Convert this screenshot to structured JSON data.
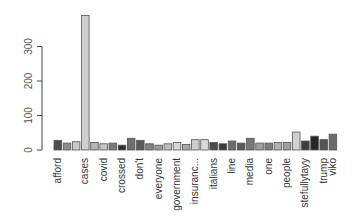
{
  "chart_data": {
    "type": "bar",
    "title": "",
    "xlabel": "",
    "ylabel": "",
    "ylim": [
      0,
      400
    ],
    "yticks": [
      0,
      100,
      200,
      300
    ],
    "grid": false,
    "legend": null,
    "x_label_rotation": -90,
    "categories": [
      "afford",
      "",
      "",
      "cases",
      "",
      "covid",
      "",
      "crossed",
      "",
      "don't",
      "",
      "everyone",
      "",
      "government",
      "",
      "insuranc...",
      "",
      "italians",
      "",
      "line",
      "",
      "media",
      "",
      "one",
      "",
      "people",
      "",
      "stefullytayy",
      "",
      "trump",
      "viko"
    ],
    "visible_tick_labels": [
      "afford",
      "cases",
      "covid",
      "crossed",
      "don't",
      "everyone",
      "government",
      "insuranc...",
      "italians",
      "line",
      "media",
      "one",
      "people",
      "stefullytayy",
      "trump",
      "viko"
    ],
    "values": [
      28,
      20,
      24,
      390,
      22,
      18,
      20,
      14,
      34,
      28,
      18,
      14,
      18,
      22,
      16,
      30,
      30,
      22,
      18,
      26,
      20,
      34,
      20,
      20,
      22,
      22,
      52,
      26,
      40,
      30,
      46
    ],
    "colors": [
      "#4d4d4d",
      "#8c8c8c",
      "#c9c9c9",
      "#cfcfcf",
      "#b3b3b3",
      "#c4c4c4",
      "#7a7a7a",
      "#2e2e2e",
      "#6e6e6e",
      "#5a5a5a",
      "#828282",
      "#9a9a9a",
      "#bdbdbd",
      "#d6d6d6",
      "#a8a8a8",
      "#cdcdcd",
      "#d9d9d9",
      "#4a4a4a",
      "#3a3a3a",
      "#6b6b6b",
      "#585858",
      "#777777",
      "#9e9e9e",
      "#7d7d7d",
      "#b0b0b0",
      "#a0a0a0",
      "#d0d0d0",
      "#3d3d3d",
      "#262626",
      "#555555",
      "#6a6a6a"
    ]
  },
  "axis": {
    "y_tick_labels": [
      "0",
      "100",
      "200",
      "300"
    ]
  }
}
